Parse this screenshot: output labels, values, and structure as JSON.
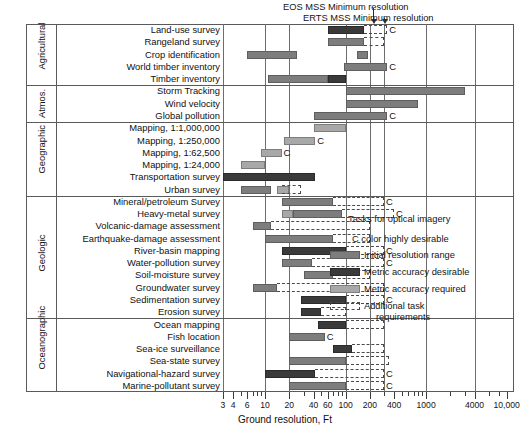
{
  "chart_data": {
    "type": "bar",
    "title": "",
    "xlabel": "Ground resolution, Ft",
    "ylabel": "",
    "scale": "log",
    "xlim": [
      3,
      12000
    ],
    "grid": true,
    "legend_position": "right-middle",
    "axis_ticks": [
      {
        "value": 3,
        "label": "3",
        "major": true
      },
      {
        "value": 4,
        "label": "4",
        "major": true
      },
      {
        "value": 5,
        "label": "",
        "major": false
      },
      {
        "value": 6,
        "label": "6",
        "major": true
      },
      {
        "value": 7,
        "label": "",
        "major": false
      },
      {
        "value": 8,
        "label": "",
        "major": false
      },
      {
        "value": 9,
        "label": "",
        "major": false
      },
      {
        "value": 10,
        "label": "10",
        "major": true
      },
      {
        "value": 20,
        "label": "20",
        "major": true
      },
      {
        "value": 30,
        "label": "",
        "major": false
      },
      {
        "value": 40,
        "label": "40",
        "major": true
      },
      {
        "value": 50,
        "label": "",
        "major": false
      },
      {
        "value": 60,
        "label": "60",
        "major": true
      },
      {
        "value": 70,
        "label": "",
        "major": false
      },
      {
        "value": 80,
        "label": "",
        "major": false
      },
      {
        "value": 90,
        "label": "",
        "major": false
      },
      {
        "value": 100,
        "label": "100",
        "major": true
      },
      {
        "value": 200,
        "label": "200",
        "major": true
      },
      {
        "value": 300,
        "label": "",
        "major": false
      },
      {
        "value": 400,
        "label": "400",
        "major": true
      },
      {
        "value": 500,
        "label": "",
        "major": false
      },
      {
        "value": 600,
        "label": "",
        "major": false
      },
      {
        "value": 700,
        "label": "",
        "major": false
      },
      {
        "value": 800,
        "label": "",
        "major": false
      },
      {
        "value": 900,
        "label": "",
        "major": false
      },
      {
        "value": 1000,
        "label": "1000",
        "major": true
      },
      {
        "value": 2000,
        "label": "",
        "major": false
      },
      {
        "value": 3000,
        "label": "",
        "major": false
      },
      {
        "value": 4000,
        "label": "4000",
        "major": true
      },
      {
        "value": 6000,
        "label": "",
        "major": false
      },
      {
        "value": 8000,
        "label": "",
        "major": false
      },
      {
        "value": 10000,
        "label": "10,000",
        "major": true
      }
    ],
    "gridlines": [
      10,
      20,
      100,
      200,
      300,
      1000,
      4000
    ],
    "categories": [
      "Land-use survey",
      "Rangeland survey",
      "Crop identification",
      "World timber inventory",
      "Timber inventory",
      "Storm Tracking",
      "Wind velocity",
      "Global pollution",
      "Mapping, 1:1,000,000",
      "Mapping, 1:250,000",
      "Mapping, 1:62,500",
      "Mapping, 1:24,000",
      "Transportation survey",
      "Urban survey",
      "Mineral/petroleum Survey",
      "Heavy-metal survey",
      "Volcanic-damage assessment",
      "Earthquake-damage assessment",
      "River-basin mapping",
      "Water-pollution survey",
      "Soil-moisture survey",
      "Groundwater survey",
      "Sedimentation survey",
      "Erosion survey",
      "Ocean mapping",
      "Fish location",
      "Sea-ice surveillance",
      "Sea-state survey",
      "Navigational-hazard survey",
      "Marine-pollutant survey"
    ],
    "groups": [
      {
        "name": "Agricultural",
        "rows": 5
      },
      {
        "name": "Atmos.",
        "rows": 3
      },
      {
        "name": "Geographic",
        "rows": 6
      },
      {
        "name": "Geologic",
        "rows": 10
      },
      {
        "name": "Oceanographic",
        "rows": 6
      }
    ],
    "series": [
      {
        "name": "Initial resolution range",
        "key": "init",
        "color": "#7d7d7d"
      },
      {
        "name": "Metric accuracy desirable",
        "key": "desir",
        "color": "#3a3a3a"
      },
      {
        "name": "Metric accuracy required",
        "key": "req",
        "color": "#a8a8a8"
      },
      {
        "name": "Additional task requirements",
        "key": "add",
        "color": "#ffffff"
      }
    ],
    "rows": [
      {
        "task": "Land-use survey",
        "bars": [
          {
            "type": "desir",
            "x0": 60,
            "x1": 170
          },
          {
            "type": "add",
            "x0": 170,
            "x1": 330
          }
        ],
        "color_desirable": true
      },
      {
        "task": "Rangeland survey",
        "bars": [
          {
            "type": "init",
            "x0": 60,
            "x1": 170
          },
          {
            "type": "add",
            "x0": 170,
            "x1": 300
          }
        ],
        "color_desirable": false
      },
      {
        "task": "Crop identification",
        "bars": [
          {
            "type": "init",
            "x0": 6,
            "x1": 25
          },
          {
            "type": "init",
            "x0": 140,
            "x1": 190
          }
        ],
        "color_desirable": false
      },
      {
        "task": "World timber inventory",
        "bars": [
          {
            "type": "init",
            "x0": 95,
            "x1": 330
          }
        ],
        "color_desirable": true
      },
      {
        "task": "Timber inventory",
        "bars": [
          {
            "type": "init",
            "x0": 11,
            "x1": 60
          },
          {
            "type": "desir",
            "x0": 60,
            "x1": 100
          }
        ],
        "color_desirable": false
      },
      {
        "task": "Storm Tracking",
        "bars": [
          {
            "type": "init",
            "x0": 100,
            "x1": 3000
          }
        ],
        "color_desirable": false
      },
      {
        "task": "Wind velocity",
        "bars": [
          {
            "type": "init",
            "x0": 100,
            "x1": 800
          }
        ],
        "color_desirable": false
      },
      {
        "task": "Global pollution",
        "bars": [
          {
            "type": "init",
            "x0": 40,
            "x1": 330
          }
        ],
        "color_desirable": true
      },
      {
        "task": "Mapping, 1:1,000,000",
        "bars": [
          {
            "type": "req",
            "x0": 40,
            "x1": 100
          }
        ],
        "color_desirable": false
      },
      {
        "task": "Mapping, 1:250,000",
        "bars": [
          {
            "type": "req",
            "x0": 17,
            "x1": 42
          }
        ],
        "color_desirable": true
      },
      {
        "task": "Mapping, 1:62,500",
        "bars": [
          {
            "type": "req",
            "x0": 9,
            "x1": 16
          }
        ],
        "color_desirable": true
      },
      {
        "task": "Mapping, 1:24,000",
        "bars": [
          {
            "type": "req",
            "x0": 5,
            "x1": 10
          }
        ],
        "color_desirable": false
      },
      {
        "task": "Transportation survey",
        "bars": [
          {
            "type": "desir",
            "x0": 3,
            "x1": 42
          }
        ],
        "color_desirable": false
      },
      {
        "task": "Urban survey",
        "bars": [
          {
            "type": "init",
            "x0": 5,
            "x1": 12
          },
          {
            "type": "req",
            "x0": 14,
            "x1": 20
          },
          {
            "type": "add",
            "x0": 16,
            "x1": 28
          }
        ],
        "color_desirable": false
      },
      {
        "task": "Mineral/petroleum Survey",
        "bars": [
          {
            "type": "init",
            "x0": 16,
            "x1": 70
          },
          {
            "type": "add",
            "x0": 70,
            "x1": 300
          }
        ],
        "color_desirable": true
      },
      {
        "task": "Heavy-metal survey",
        "bars": [
          {
            "type": "req",
            "x0": 16,
            "x1": 22
          },
          {
            "type": "init",
            "x0": 22,
            "x1": 90
          },
          {
            "type": "add",
            "x0": 90,
            "x1": 400
          }
        ],
        "color_desirable": true
      },
      {
        "task": "Volcanic-damage assessment",
        "bars": [
          {
            "type": "init",
            "x0": 7,
            "x1": 12
          },
          {
            "type": "add",
            "x0": 12,
            "x1": 200
          }
        ],
        "color_desirable": false
      },
      {
        "task": "Earthquake-damage assessment",
        "bars": [
          {
            "type": "init",
            "x0": 10,
            "x1": 70
          },
          {
            "type": "add",
            "x0": 70,
            "x1": 200
          }
        ],
        "color_desirable": false
      },
      {
        "task": "River-basin mapping",
        "bars": [
          {
            "type": "desir",
            "x0": 16,
            "x1": 100
          },
          {
            "type": "add",
            "x0": 100,
            "x1": 300
          }
        ],
        "color_desirable": true
      },
      {
        "task": "Water-pollution survey",
        "bars": [
          {
            "type": "init",
            "x0": 16,
            "x1": 38
          },
          {
            "type": "add",
            "x0": 38,
            "x1": 300
          }
        ],
        "color_desirable": true
      },
      {
        "task": "Soil-moisture survey",
        "bars": [
          {
            "type": "init",
            "x0": 30,
            "x1": 70
          },
          {
            "type": "add",
            "x0": 70,
            "x1": 200
          }
        ],
        "color_desirable": false
      },
      {
        "task": "Groundwater survey",
        "bars": [
          {
            "type": "init",
            "x0": 7,
            "x1": 14
          },
          {
            "type": "add",
            "x0": 14,
            "x1": 300
          }
        ],
        "color_desirable": false
      },
      {
        "task": "Sedimentation survey",
        "bars": [
          {
            "type": "desir",
            "x0": 28,
            "x1": 100
          },
          {
            "type": "add",
            "x0": 100,
            "x1": 300
          }
        ],
        "color_desirable": true
      },
      {
        "task": "Erosion survey",
        "bars": [
          {
            "type": "desir",
            "x0": 28,
            "x1": 50
          },
          {
            "type": "add",
            "x0": 50,
            "x1": 100
          }
        ],
        "color_desirable": false
      },
      {
        "task": "Ocean mapping",
        "bars": [
          {
            "type": "desir",
            "x0": 45,
            "x1": 100
          },
          {
            "type": "add",
            "x0": 100,
            "x1": 300
          }
        ],
        "color_desirable": false
      },
      {
        "task": "Fish location",
        "bars": [
          {
            "type": "init",
            "x0": 20,
            "x1": 55
          }
        ],
        "color_desirable": true
      },
      {
        "task": "Sea-ice surveillance",
        "bars": [
          {
            "type": "desir",
            "x0": 70,
            "x1": 120
          },
          {
            "type": "add",
            "x0": 120,
            "x1": 300
          }
        ],
        "color_desirable": false
      },
      {
        "task": "Sea-state survey",
        "bars": [
          {
            "type": "init",
            "x0": 20,
            "x1": 100
          },
          {
            "type": "add",
            "x0": 100,
            "x1": 350
          }
        ],
        "color_desirable": false
      },
      {
        "task": "Navigational-hazard survey",
        "bars": [
          {
            "type": "desir",
            "x0": 10,
            "x1": 42
          },
          {
            "type": "add",
            "x0": 42,
            "x1": 300
          }
        ],
        "color_desirable": true
      },
      {
        "task": "Marine-pollutant survey",
        "bars": [
          {
            "type": "init",
            "x0": 20,
            "x1": 100
          },
          {
            "type": "add",
            "x0": 100,
            "x1": 300
          }
        ],
        "color_desirable": true
      }
    ],
    "annotations": [
      {
        "name": "eos-callout",
        "text": "EOS MSS Minimum resolution",
        "value": 220
      },
      {
        "name": "erts-callout",
        "text": "ERTS MSS Minimum resolution",
        "value": 300
      }
    ]
  },
  "legend": {
    "heading": "Tasks for optical imagery",
    "c_note": "C color highly desirable",
    "items": [
      {
        "label": "Initial resolution range",
        "key": "init"
      },
      {
        "label": "Metric accuracy desirable",
        "key": "desir"
      },
      {
        "label": "Metric accuracy required",
        "key": "req"
      },
      {
        "label": "Additional task",
        "label2": "requirements",
        "key": "add"
      }
    ]
  },
  "marks": {
    "c": "C"
  }
}
